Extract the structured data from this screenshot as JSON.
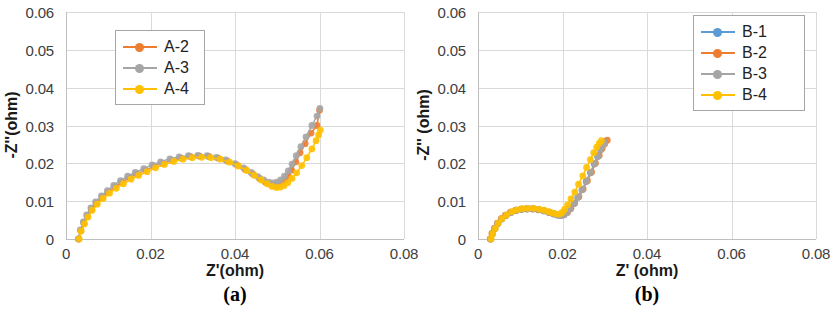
{
  "figure": {
    "panels": [
      {
        "id": "a",
        "caption": "(a)",
        "xlabel": "Z'(ohm)",
        "ylabel": "-Z''(ohm)",
        "xticks": [
          "0",
          "0.02",
          "0.04",
          "0.06",
          "0.08"
        ],
        "yticks": [
          "0",
          "0.01",
          "0.02",
          "0.03",
          "0.04",
          "0.05",
          "0.06"
        ],
        "legend": [
          {
            "label": "A-2",
            "color": "#ED7D31"
          },
          {
            "label": "A-3",
            "color": "#A5A5A5"
          },
          {
            "label": "A-4",
            "color": "#FFC000"
          }
        ]
      },
      {
        "id": "b",
        "caption": "(b)",
        "xlabel": "Z' (ohm)",
        "ylabel": "-Z'' (ohm)",
        "xticks": [
          "0",
          "0.02",
          "0.04",
          "0.06",
          "0.08"
        ],
        "yticks": [
          "0",
          "0.01",
          "0.02",
          "0.03",
          "0.04",
          "0.05",
          "0.06"
        ],
        "legend": [
          {
            "label": "B-1",
            "color": "#5B9BD5"
          },
          {
            "label": "B-2",
            "color": "#ED7D31"
          },
          {
            "label": "B-3",
            "color": "#A5A5A5"
          },
          {
            "label": "B-4",
            "color": "#FFC000"
          }
        ]
      }
    ]
  },
  "chart_data": [
    {
      "type": "scatter",
      "panel": "a",
      "title": "",
      "xlabel": "Z'(ohm)",
      "ylabel": "-Z''(ohm)",
      "xlim": [
        0,
        0.08
      ],
      "ylim": [
        0,
        0.06
      ],
      "xticks": [
        0,
        0.02,
        0.04,
        0.06,
        0.08
      ],
      "yticks": [
        0,
        0.01,
        0.02,
        0.03,
        0.04,
        0.05,
        0.06
      ],
      "grid": true,
      "legend_position": "upper-left-inside",
      "series": [
        {
          "name": "A-2",
          "color": "#ED7D31",
          "x": [
            0.003,
            0.0035,
            0.0042,
            0.005,
            0.006,
            0.0072,
            0.0086,
            0.01,
            0.0116,
            0.0132,
            0.015,
            0.0168,
            0.0188,
            0.0208,
            0.0228,
            0.025,
            0.0272,
            0.0294,
            0.0316,
            0.0338,
            0.036,
            0.0382,
            0.0404,
            0.0424,
            0.0442,
            0.0458,
            0.0472,
            0.0484,
            0.0494,
            0.0502,
            0.051,
            0.0518,
            0.0526,
            0.0534,
            0.0544,
            0.0554,
            0.0566,
            0.058,
            0.0594,
            0.06
          ],
          "y": [
            0.0,
            0.0022,
            0.0042,
            0.006,
            0.0078,
            0.0094,
            0.011,
            0.0124,
            0.0138,
            0.015,
            0.0162,
            0.0172,
            0.0182,
            0.0192,
            0.02,
            0.0208,
            0.0214,
            0.0218,
            0.0219,
            0.0218,
            0.0214,
            0.0206,
            0.0196,
            0.0184,
            0.0172,
            0.016,
            0.015,
            0.0144,
            0.0141,
            0.0142,
            0.0146,
            0.0154,
            0.0166,
            0.0182,
            0.0204,
            0.0228,
            0.0252,
            0.028,
            0.03,
            0.034
          ]
        },
        {
          "name": "A-3",
          "color": "#A5A5A5",
          "x": [
            0.0029,
            0.0034,
            0.0041,
            0.0049,
            0.0059,
            0.007,
            0.0084,
            0.0098,
            0.0113,
            0.0129,
            0.0146,
            0.0164,
            0.0184,
            0.0204,
            0.0224,
            0.0246,
            0.0268,
            0.029,
            0.0312,
            0.0334,
            0.0356,
            0.0378,
            0.04,
            0.042,
            0.0438,
            0.0454,
            0.0468,
            0.048,
            0.049,
            0.0499,
            0.0508,
            0.0517,
            0.0526,
            0.0535,
            0.0545,
            0.0556,
            0.0568,
            0.0582,
            0.0594,
            0.0601
          ],
          "y": [
            0.0,
            0.0024,
            0.0045,
            0.0064,
            0.0082,
            0.0098,
            0.0114,
            0.0128,
            0.0142,
            0.0154,
            0.0166,
            0.0176,
            0.0186,
            0.0196,
            0.0204,
            0.0212,
            0.0217,
            0.022,
            0.0221,
            0.022,
            0.0216,
            0.0209,
            0.0199,
            0.0188,
            0.0176,
            0.0165,
            0.0156,
            0.015,
            0.0148,
            0.015,
            0.0156,
            0.0166,
            0.018,
            0.0198,
            0.022,
            0.0244,
            0.027,
            0.03,
            0.0325,
            0.0345
          ]
        },
        {
          "name": "A-4",
          "color": "#FFC000",
          "x": [
            0.0031,
            0.0036,
            0.0044,
            0.0052,
            0.0062,
            0.0074,
            0.0088,
            0.0103,
            0.0119,
            0.0136,
            0.0154,
            0.0172,
            0.0192,
            0.0212,
            0.0233,
            0.0255,
            0.0277,
            0.0299,
            0.0321,
            0.0343,
            0.0365,
            0.0387,
            0.0408,
            0.0428,
            0.0446,
            0.0462,
            0.0476,
            0.0488,
            0.0498,
            0.0507,
            0.0516,
            0.0525,
            0.0535,
            0.0546,
            0.0558,
            0.057,
            0.0582,
            0.0592,
            0.0598,
            0.0602
          ],
          "y": [
            0.0,
            0.0021,
            0.004,
            0.0058,
            0.0076,
            0.0092,
            0.0107,
            0.0121,
            0.0134,
            0.0146,
            0.0158,
            0.0168,
            0.0178,
            0.0188,
            0.0197,
            0.0205,
            0.0211,
            0.0215,
            0.0216,
            0.0215,
            0.0211,
            0.0203,
            0.0193,
            0.0181,
            0.0168,
            0.0156,
            0.0146,
            0.0139,
            0.0136,
            0.0137,
            0.0141,
            0.0149,
            0.016,
            0.0175,
            0.0194,
            0.0215,
            0.0238,
            0.026,
            0.0275,
            0.0288
          ]
        }
      ]
    },
    {
      "type": "scatter",
      "panel": "b",
      "title": "",
      "xlabel": "Z' (ohm)",
      "ylabel": "-Z'' (ohm)",
      "xlim": [
        0,
        0.08
      ],
      "ylim": [
        0,
        0.06
      ],
      "xticks": [
        0,
        0.02,
        0.04,
        0.06,
        0.08
      ],
      "yticks": [
        0,
        0.01,
        0.02,
        0.03,
        0.04,
        0.05,
        0.06
      ],
      "grid": true,
      "legend_position": "upper-right-inside",
      "series": [
        {
          "name": "B-1",
          "color": "#5B9BD5",
          "x": [
            0.003,
            0.0034,
            0.004,
            0.0047,
            0.0056,
            0.0066,
            0.0078,
            0.009,
            0.0103,
            0.0116,
            0.013,
            0.0143,
            0.0156,
            0.0168,
            0.0179,
            0.0188,
            0.0196,
            0.0203,
            0.021,
            0.0218,
            0.0227,
            0.0236,
            0.0246,
            0.0256,
            0.0266,
            0.0275,
            0.0283,
            0.029,
            0.0296,
            0.03
          ],
          "y": [
            0.0,
            0.0014,
            0.0028,
            0.0041,
            0.0053,
            0.0062,
            0.007,
            0.0075,
            0.0078,
            0.0079,
            0.0079,
            0.0077,
            0.0074,
            0.007,
            0.0066,
            0.0063,
            0.0062,
            0.0064,
            0.007,
            0.008,
            0.0094,
            0.011,
            0.013,
            0.0152,
            0.0175,
            0.0198,
            0.0218,
            0.0236,
            0.025,
            0.0258
          ]
        },
        {
          "name": "B-2",
          "color": "#ED7D31",
          "x": [
            0.0029,
            0.0033,
            0.0039,
            0.0046,
            0.0055,
            0.0065,
            0.0077,
            0.0089,
            0.0102,
            0.0115,
            0.0129,
            0.0142,
            0.0155,
            0.0167,
            0.0178,
            0.0188,
            0.0196,
            0.0204,
            0.0212,
            0.022,
            0.0229,
            0.0239,
            0.0249,
            0.0259,
            0.0269,
            0.0278,
            0.0287,
            0.0294,
            0.03,
            0.0306
          ],
          "y": [
            0.0,
            0.0015,
            0.0029,
            0.0042,
            0.0054,
            0.0063,
            0.0071,
            0.0076,
            0.0079,
            0.008,
            0.008,
            0.0078,
            0.0075,
            0.0071,
            0.0067,
            0.0064,
            0.0063,
            0.0065,
            0.0071,
            0.0081,
            0.0095,
            0.0112,
            0.0132,
            0.0154,
            0.0177,
            0.02,
            0.0221,
            0.0239,
            0.0252,
            0.0261
          ]
        },
        {
          "name": "B-3",
          "color": "#A5A5A5",
          "x": [
            0.003,
            0.0034,
            0.004,
            0.0047,
            0.0056,
            0.0067,
            0.0079,
            0.0091,
            0.0104,
            0.0117,
            0.0131,
            0.0144,
            0.0157,
            0.0169,
            0.018,
            0.0189,
            0.0197,
            0.0204,
            0.0211,
            0.0219,
            0.0228,
            0.0237,
            0.0247,
            0.0257,
            0.0267,
            0.0276,
            0.0284,
            0.0291,
            0.0296,
            0.03
          ],
          "y": [
            0.0,
            0.0014,
            0.0028,
            0.0041,
            0.0053,
            0.0063,
            0.0071,
            0.0076,
            0.0079,
            0.008,
            0.008,
            0.0078,
            0.0075,
            0.0071,
            0.0067,
            0.0064,
            0.0062,
            0.0064,
            0.007,
            0.008,
            0.0094,
            0.0111,
            0.0131,
            0.0153,
            0.0176,
            0.0199,
            0.0219,
            0.0236,
            0.0248,
            0.0256
          ]
        },
        {
          "name": "B-4",
          "color": "#FFC000",
          "x": [
            0.0031,
            0.0035,
            0.0041,
            0.0048,
            0.0057,
            0.0068,
            0.008,
            0.0092,
            0.0105,
            0.0118,
            0.0131,
            0.0144,
            0.0156,
            0.0167,
            0.0177,
            0.0186,
            0.0193,
            0.0199,
            0.0205,
            0.0212,
            0.022,
            0.0229,
            0.0238,
            0.0248,
            0.0257,
            0.0266,
            0.0274,
            0.0281,
            0.0287,
            0.0292
          ],
          "y": [
            0.0,
            0.0014,
            0.0028,
            0.0042,
            0.0054,
            0.0064,
            0.0072,
            0.0077,
            0.008,
            0.0081,
            0.0081,
            0.0079,
            0.0076,
            0.0072,
            0.0069,
            0.0066,
            0.0066,
            0.007,
            0.0078,
            0.009,
            0.0106,
            0.0124,
            0.0145,
            0.0167,
            0.0189,
            0.021,
            0.0228,
            0.0243,
            0.0253,
            0.026
          ]
        }
      ]
    }
  ]
}
